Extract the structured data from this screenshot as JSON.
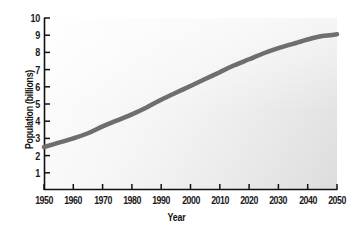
{
  "chart_data": {
    "type": "line",
    "title": "",
    "xlabel": "Year",
    "ylabel": "Population (billions)",
    "xlim": [
      1950,
      2050
    ],
    "ylim": [
      0,
      10
    ],
    "grid": false,
    "legend": "none",
    "line_color": "#6e6e6e",
    "line_width_px": 4.5,
    "x_ticks": [
      1950,
      1960,
      1970,
      1980,
      1990,
      2000,
      2010,
      2020,
      2030,
      2040,
      2050
    ],
    "x_tick_labels": [
      "1950",
      "1960",
      "1970",
      "1980",
      "1990",
      "2000",
      "2010",
      "2020",
      "2030",
      "2040",
      "2050"
    ],
    "y_ticks": [
      1,
      2,
      3,
      4,
      5,
      6,
      7,
      8,
      9,
      10
    ],
    "y_tick_labels": [
      "1",
      "2",
      "3",
      "4",
      "5",
      "6",
      "7",
      "8",
      "9",
      "10"
    ],
    "series": [
      {
        "name": "World population",
        "x": [
          1950,
          1955,
          1960,
          1965,
          1970,
          1975,
          1980,
          1985,
          1990,
          1995,
          2000,
          2005,
          2010,
          2015,
          2020,
          2025,
          2030,
          2035,
          2040,
          2045,
          2050
        ],
        "values": [
          2.5,
          2.75,
          3.0,
          3.3,
          3.7,
          4.05,
          4.4,
          4.8,
          5.25,
          5.65,
          6.05,
          6.45,
          6.85,
          7.25,
          7.6,
          7.95,
          8.25,
          8.5,
          8.75,
          8.95,
          9.05
        ]
      }
    ]
  },
  "figure": {
    "background": "#ffffff",
    "plot_background_light": "#fdfdfd",
    "plot_background_dark": "#e2e2e2",
    "axis_color": "#111111"
  }
}
